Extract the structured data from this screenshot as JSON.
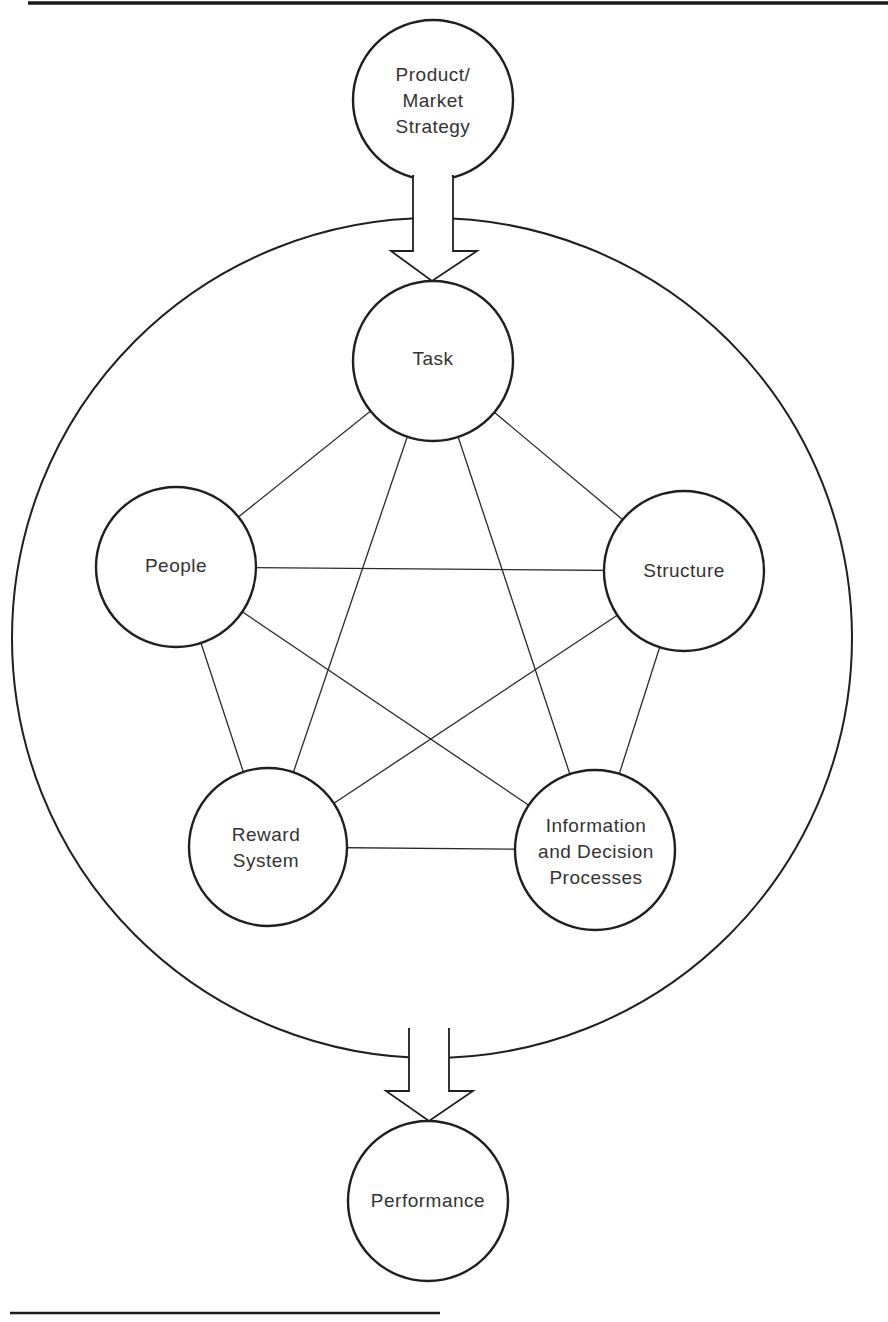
{
  "figure": {
    "nodes": {
      "strategy": {
        "lines": [
          "Product/",
          "Market",
          "Strategy"
        ],
        "cx": 433,
        "cy": 100,
        "r": 80
      },
      "task": {
        "lines": [
          "Task"
        ],
        "cx": 433,
        "cy": 361,
        "r": 80
      },
      "people": {
        "lines": [
          "People"
        ],
        "cx": 176,
        "cy": 567,
        "r": 80
      },
      "structure": {
        "lines": [
          "Structure"
        ],
        "cx": 684,
        "cy": 571,
        "r": 80
      },
      "reward": {
        "lines": [
          "Reward",
          "System"
        ],
        "cx": 268,
        "cy": 847,
        "r": 79
      },
      "information": {
        "lines": [
          "Information",
          "and Decision",
          "Processes"
        ],
        "cx": 595,
        "cy": 850,
        "r": 80
      },
      "performance": {
        "lines": [
          "Performance"
        ],
        "cx": 428,
        "cy": 1201,
        "r": 80
      }
    },
    "outer_circle": {
      "cx": 432,
      "cy": 638,
      "r": 420
    },
    "arrows": [
      {
        "from": "Product/Market Strategy",
        "to": "Task"
      },
      {
        "from": "organization system",
        "to": "Performance"
      }
    ],
    "connections": [
      [
        "Task",
        "People"
      ],
      [
        "Task",
        "Structure"
      ],
      [
        "Task",
        "Reward System"
      ],
      [
        "Task",
        "Information and Decision Processes"
      ],
      [
        "People",
        "Structure"
      ],
      [
        "People",
        "Reward System"
      ],
      [
        "People",
        "Information and Decision Processes"
      ],
      [
        "Structure",
        "Reward System"
      ],
      [
        "Structure",
        "Information and Decision Processes"
      ],
      [
        "Reward System",
        "Information and Decision Processes"
      ]
    ],
    "colors": {
      "line": "#1f1f1f",
      "text": "#333333",
      "background": "#ffffff"
    }
  }
}
